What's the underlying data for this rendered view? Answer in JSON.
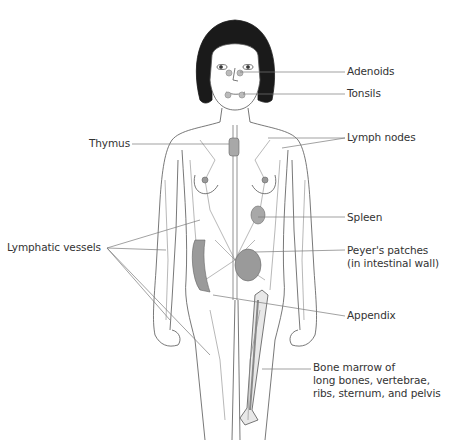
{
  "diagram": {
    "colors": {
      "line": "#555555",
      "leader": "#7a7a7a",
      "hair": "#1a1a1a",
      "organ_fill": "#9a9a9a",
      "node_fill": "#a8a8a8",
      "text": "#333333",
      "background": "#ffffff"
    },
    "labels": {
      "adenoids": "Adenoids",
      "tonsils": "Tonsils",
      "thymus": "Thymus",
      "lymph_nodes": "Lymph nodes",
      "spleen": "Spleen",
      "peyers_line1": "Peyer's patches",
      "peyers_line2": "(in intestinal wall)",
      "lymphatic_vessels": "Lymphatic vessels",
      "appendix": "Appendix",
      "marrow_line1": "Bone marrow of",
      "marrow_line2": "long bones, vertebrae,",
      "marrow_line3": "ribs, sternum, and pelvis"
    }
  }
}
